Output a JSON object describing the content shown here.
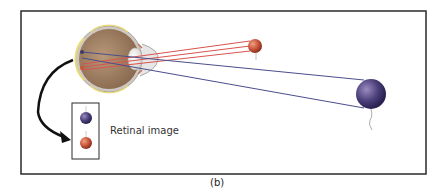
{
  "figure": {
    "caption": "(b)",
    "retinal_image_label": "Retinal image",
    "colors": {
      "near_ray": "#d9534f",
      "far_ray": "#4a4e8c",
      "near_ball": "#c8553a",
      "far_ball": "#4b3f7a",
      "frame": "#2a2a2a",
      "eye_body": "#a8876a",
      "retina": "#e8dc7a"
    },
    "objects": [
      {
        "name": "near-ball",
        "color": "red",
        "relative_size": "small",
        "position": "near"
      },
      {
        "name": "far-ball",
        "color": "purple",
        "relative_size": "large",
        "position": "far"
      }
    ]
  }
}
